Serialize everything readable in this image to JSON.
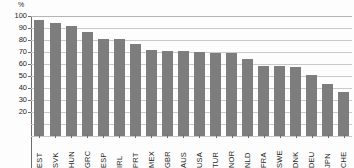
{
  "chart_data": {
    "type": "bar",
    "title": "",
    "subtitle": "",
    "xlabel": "",
    "ylabel": "%",
    "ylim": [
      0,
      100
    ],
    "yticks": [
      100,
      90,
      80,
      70,
      60,
      50,
      40,
      30,
      20
    ],
    "ytick_labels": [
      "100",
      "90",
      "80",
      "70",
      "60",
      "50",
      "40",
      "30",
      "20"
    ],
    "grid": true,
    "legend": "none",
    "bar_color": "#7d7d7d",
    "categories": [
      "EST",
      "SVK",
      "HUN",
      "GRC",
      "ESP",
      "IRL",
      "PRT",
      "MEX",
      "GBR",
      "AUS",
      "USA",
      "TUR",
      "NOR",
      "NLD",
      "FRA",
      "SWE",
      "DNK",
      "DEU",
      "JPN",
      "CHE"
    ],
    "values": [
      97,
      94,
      92,
      87,
      81,
      80.5,
      76.5,
      72,
      71,
      71,
      70,
      69,
      69,
      64,
      58,
      58,
      57.5,
      50.5,
      43,
      36.5
    ]
  },
  "axes": {
    "y_unit_label": "%"
  }
}
